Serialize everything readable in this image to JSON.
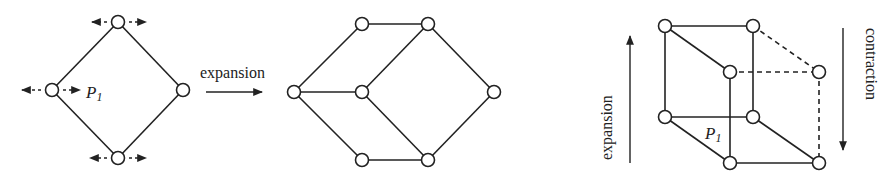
{
  "diagram_1": {
    "name": "square-lattice",
    "point_label": "P",
    "point_label_sub": "1",
    "nodes": [
      {
        "id": "top",
        "x": 118,
        "y": 22
      },
      {
        "id": "left",
        "x": 52,
        "y": 90
      },
      {
        "id": "right",
        "x": 183,
        "y": 90
      },
      {
        "id": "bottom",
        "x": 118,
        "y": 158
      }
    ],
    "edges": [
      [
        "top",
        "left"
      ],
      [
        "top",
        "right"
      ],
      [
        "left",
        "bottom"
      ],
      [
        "right",
        "bottom"
      ]
    ]
  },
  "transition_arrow": {
    "label": "expansion"
  },
  "diagram_2": {
    "name": "expanded-lattice",
    "nodes": [
      {
        "id": "L",
        "x": 294,
        "y": 92
      },
      {
        "id": "TL",
        "x": 362,
        "y": 24
      },
      {
        "id": "TR",
        "x": 428,
        "y": 24
      },
      {
        "id": "M",
        "x": 362,
        "y": 92
      },
      {
        "id": "R",
        "x": 494,
        "y": 92
      },
      {
        "id": "BL",
        "x": 362,
        "y": 160
      },
      {
        "id": "BR",
        "x": 428,
        "y": 160
      }
    ],
    "edges": [
      [
        "L",
        "TL"
      ],
      [
        "TL",
        "TR"
      ],
      [
        "L",
        "M"
      ],
      [
        "M",
        "TR"
      ],
      [
        "TR",
        "R"
      ],
      [
        "L",
        "BL"
      ],
      [
        "BL",
        "BR"
      ],
      [
        "M",
        "BR"
      ],
      [
        "BR",
        "R"
      ]
    ]
  },
  "diagram_3": {
    "name": "cube-lattice",
    "left_arrow_label": "expansion",
    "right_arrow_label": "contraction",
    "point_label": "P",
    "point_label_sub": "1"
  }
}
